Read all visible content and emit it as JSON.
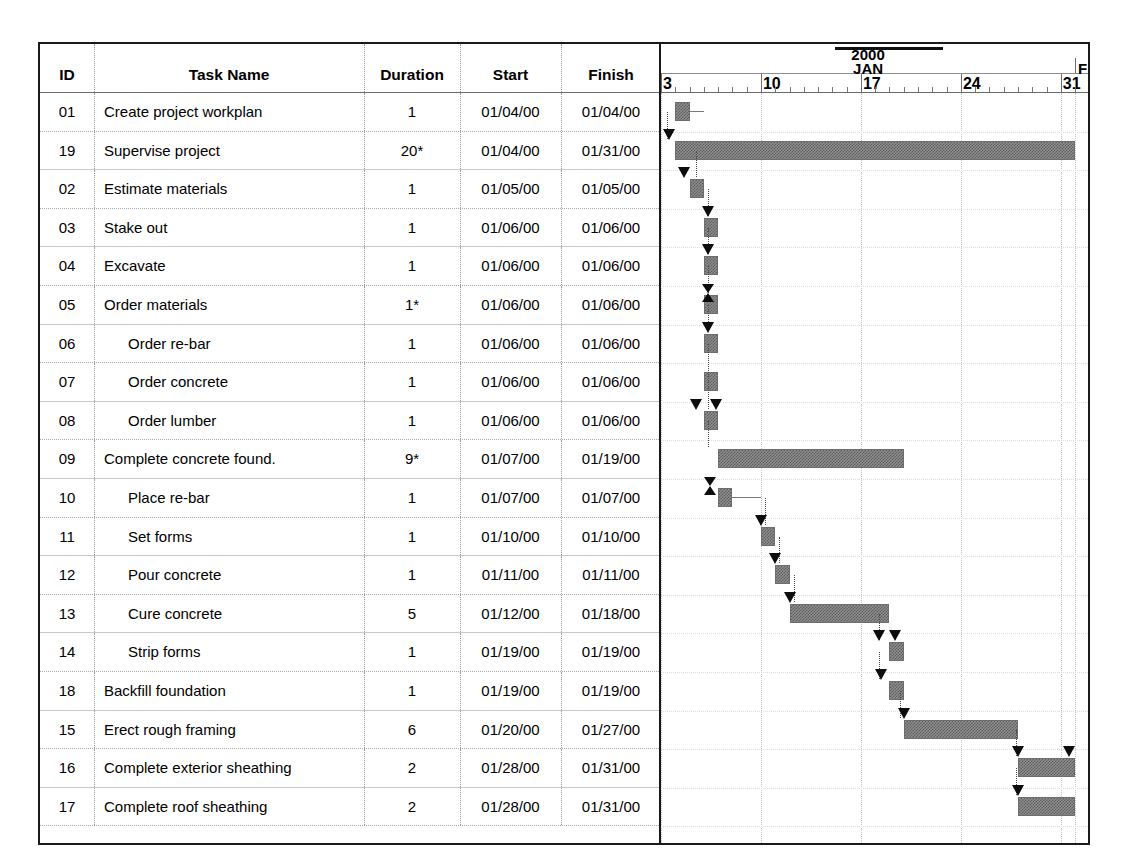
{
  "table": {
    "columns": [
      "ID",
      "Task Name",
      "Duration",
      "Start",
      "Finish"
    ],
    "rows": [
      {
        "id": "01",
        "name": "Create project workplan",
        "indent": 0,
        "duration": "1",
        "start": "01/04/00",
        "finish": "01/04/00"
      },
      {
        "id": "19",
        "name": "Supervise project",
        "indent": 0,
        "duration": "20*",
        "start": "01/04/00",
        "finish": "01/31/00"
      },
      {
        "id": "02",
        "name": "Estimate materials",
        "indent": 0,
        "duration": "1",
        "start": "01/05/00",
        "finish": "01/05/00"
      },
      {
        "id": "03",
        "name": "Stake out",
        "indent": 0,
        "duration": "1",
        "start": "01/06/00",
        "finish": "01/06/00"
      },
      {
        "id": "04",
        "name": "Excavate",
        "indent": 0,
        "duration": "1",
        "start": "01/06/00",
        "finish": "01/06/00"
      },
      {
        "id": "05",
        "name": "Order materials",
        "indent": 0,
        "duration": "1*",
        "start": "01/06/00",
        "finish": "01/06/00"
      },
      {
        "id": "06",
        "name": "Order re-bar",
        "indent": 1,
        "duration": "1",
        "start": "01/06/00",
        "finish": "01/06/00"
      },
      {
        "id": "07",
        "name": "Order concrete",
        "indent": 1,
        "duration": "1",
        "start": "01/06/00",
        "finish": "01/06/00"
      },
      {
        "id": "08",
        "name": "Order lumber",
        "indent": 1,
        "duration": "1",
        "start": "01/06/00",
        "finish": "01/06/00"
      },
      {
        "id": "09",
        "name": "Complete concrete found.",
        "indent": 0,
        "duration": "9*",
        "start": "01/07/00",
        "finish": "01/19/00"
      },
      {
        "id": "10",
        "name": "Place re-bar",
        "indent": 1,
        "duration": "1",
        "start": "01/07/00",
        "finish": "01/07/00"
      },
      {
        "id": "11",
        "name": "Set forms",
        "indent": 1,
        "duration": "1",
        "start": "01/10/00",
        "finish": "01/10/00"
      },
      {
        "id": "12",
        "name": "Pour concrete",
        "indent": 1,
        "duration": "1",
        "start": "01/11/00",
        "finish": "01/11/00"
      },
      {
        "id": "13",
        "name": "Cure concrete",
        "indent": 1,
        "duration": "5",
        "start": "01/12/00",
        "finish": "01/18/00"
      },
      {
        "id": "14",
        "name": "Strip forms",
        "indent": 1,
        "duration": "1",
        "start": "01/19/00",
        "finish": "01/19/00"
      },
      {
        "id": "18",
        "name": "Backfill foundation",
        "indent": 0,
        "duration": "1",
        "start": "01/19/00",
        "finish": "01/19/00"
      },
      {
        "id": "15",
        "name": "Erect rough framing",
        "indent": 0,
        "duration": "6",
        "start": "01/20/00",
        "finish": "01/27/00"
      },
      {
        "id": "16",
        "name": "Complete exterior sheathing",
        "indent": 0,
        "duration": "2",
        "start": "01/28/00",
        "finish": "01/31/00"
      },
      {
        "id": "17",
        "name": "Complete roof sheathing",
        "indent": 0,
        "duration": "2",
        "start": "01/28/00",
        "finish": "01/31/00"
      }
    ]
  },
  "timeline": {
    "year_label": "2000",
    "month_label": "JAN",
    "next_month_label": "F",
    "week_labels": [
      "3",
      "10",
      "17",
      "24",
      "31"
    ],
    "minor_tick_interval_days": 1,
    "px_per_day": 14.28,
    "day_origin_label": "3"
  },
  "chart_data": {
    "type": "gantt",
    "xlabel": "",
    "ylabel": "",
    "axis": {
      "year": "2000",
      "month": "JAN",
      "next_month": "F",
      "tick_labels": [
        "3",
        "10",
        "17",
        "24",
        "31"
      ],
      "range_start": "01/03/00",
      "range_end": "02/01/00",
      "grid": true
    },
    "bar_fill_color": "#8f8f8f",
    "bar_edge_color": "#6d6d6d",
    "arrow_color": "#0d0d0d",
    "tasks": [
      {
        "id": "01",
        "name": "Create project workplan",
        "duration": "1",
        "start": "01/04/00",
        "finish": "01/04/00",
        "start_day": 4,
        "end_day": 4,
        "summary": false
      },
      {
        "id": "19",
        "name": "Supervise project",
        "duration": "20*",
        "start": "01/04/00",
        "finish": "01/31/00",
        "start_day": 4,
        "end_day": 31,
        "summary": true
      },
      {
        "id": "02",
        "name": "Estimate materials",
        "duration": "1",
        "start": "01/05/00",
        "finish": "01/05/00",
        "start_day": 5,
        "end_day": 5,
        "summary": false
      },
      {
        "id": "03",
        "name": "Stake out",
        "duration": "1",
        "start": "01/06/00",
        "finish": "01/06/00",
        "start_day": 6,
        "end_day": 6,
        "summary": false
      },
      {
        "id": "04",
        "name": "Excavate",
        "duration": "1",
        "start": "01/06/00",
        "finish": "01/06/00",
        "start_day": 6,
        "end_day": 6,
        "summary": false
      },
      {
        "id": "05",
        "name": "Order materials",
        "duration": "1*",
        "start": "01/06/00",
        "finish": "01/06/00",
        "start_day": 6,
        "end_day": 6,
        "summary": true
      },
      {
        "id": "06",
        "name": "Order re-bar",
        "duration": "1",
        "start": "01/06/00",
        "finish": "01/06/00",
        "start_day": 6,
        "end_day": 6,
        "summary": false
      },
      {
        "id": "07",
        "name": "Order concrete",
        "duration": "1",
        "start": "01/06/00",
        "finish": "01/06/00",
        "start_day": 6,
        "end_day": 6,
        "summary": false
      },
      {
        "id": "08",
        "name": "Order lumber",
        "duration": "1",
        "start": "01/06/00",
        "finish": "01/06/00",
        "start_day": 6,
        "end_day": 6,
        "summary": false
      },
      {
        "id": "09",
        "name": "Complete concrete found.",
        "duration": "9*",
        "start": "01/07/00",
        "finish": "01/19/00",
        "start_day": 7,
        "end_day": 19,
        "summary": true
      },
      {
        "id": "10",
        "name": "Place re-bar",
        "duration": "1",
        "start": "01/07/00",
        "finish": "01/07/00",
        "start_day": 7,
        "end_day": 7,
        "summary": false
      },
      {
        "id": "11",
        "name": "Set forms",
        "duration": "1",
        "start": "01/10/00",
        "finish": "01/10/00",
        "start_day": 10,
        "end_day": 10,
        "summary": false
      },
      {
        "id": "12",
        "name": "Pour concrete",
        "duration": "1",
        "start": "01/11/00",
        "finish": "01/11/00",
        "start_day": 11,
        "end_day": 11,
        "summary": false
      },
      {
        "id": "13",
        "name": "Cure concrete",
        "duration": "5",
        "start": "01/12/00",
        "finish": "01/18/00",
        "start_day": 12,
        "end_day": 18,
        "summary": false
      },
      {
        "id": "14",
        "name": "Strip forms",
        "duration": "1",
        "start": "01/19/00",
        "finish": "01/19/00",
        "start_day": 19,
        "end_day": 19,
        "summary": false
      },
      {
        "id": "18",
        "name": "Backfill foundation",
        "duration": "1",
        "start": "01/19/00",
        "finish": "01/19/00",
        "start_day": 19,
        "end_day": 19,
        "summary": false
      },
      {
        "id": "15",
        "name": "Erect rough framing",
        "duration": "6",
        "start": "01/20/00",
        "finish": "01/27/00",
        "start_day": 20,
        "end_day": 27,
        "summary": false
      },
      {
        "id": "16",
        "name": "Complete exterior sheathing",
        "duration": "2",
        "start": "01/28/00",
        "finish": "01/31/00",
        "start_day": 28,
        "end_day": 31,
        "summary": false
      },
      {
        "id": "17",
        "name": "Complete roof sheathing",
        "duration": "2",
        "start": "01/28/00",
        "finish": "01/31/00",
        "start_day": 28,
        "end_day": 31,
        "summary": false
      }
    ]
  }
}
